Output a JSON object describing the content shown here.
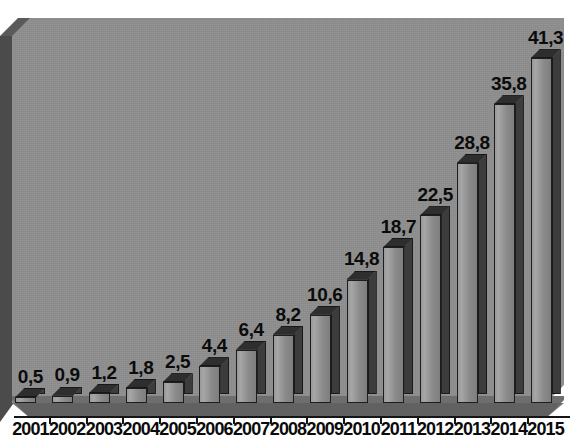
{
  "chart_data": {
    "type": "bar",
    "title": "",
    "subtitle": "",
    "xlabel": "",
    "ylabel": "",
    "legend": [],
    "grid": false,
    "legend_position": "none",
    "decimal_separator": ",",
    "ylim": [
      0,
      43.5
    ],
    "categories": [
      "2001",
      "2002",
      "2003",
      "2004",
      "2005",
      "2006",
      "2007",
      "2008",
      "2009",
      "2010",
      "2011",
      "2012",
      "2013",
      "2014",
      "2015"
    ],
    "values": [
      0.5,
      0.9,
      1.2,
      1.8,
      2.5,
      4.4,
      6.4,
      8.2,
      10.6,
      14.8,
      18.7,
      22.5,
      28.8,
      35.8,
      41.3
    ],
    "data_labels": [
      "0,5",
      "0,9",
      "1,2",
      "1,8",
      "2,5",
      "4,4",
      "6,4",
      "8,2",
      "10,6",
      "14,8",
      "18,7",
      "22,5",
      "28,8",
      "35,8",
      "41,3"
    ],
    "colors": {
      "bar_front": "#9a9a9a",
      "bar_side": "#3c3c3c",
      "bar_top": "#2e2e2e",
      "plot_background": "#8f8f8f",
      "floor": "#6e6e6e",
      "left_wall": "#4b4b4b",
      "label_text": "#0b0b0b",
      "axis_line": "#151515",
      "page_background": "#ffffff"
    }
  }
}
